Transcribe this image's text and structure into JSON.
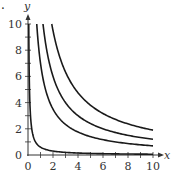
{
  "chart_data": {
    "type": "line",
    "title": "",
    "xlabel": "x",
    "ylabel": "y",
    "xlim": [
      0,
      10
    ],
    "ylim": [
      0,
      10
    ],
    "grid": false,
    "legend": null,
    "x_ticks": [
      0,
      2,
      4,
      6,
      8,
      10
    ],
    "y_ticks": [
      0,
      2,
      4,
      6,
      8,
      10
    ],
    "x_minor_step": 1,
    "y_minor_step": 1,
    "series": [
      {
        "name": "k=0.6",
        "k": 0.6,
        "x": [
          0.06,
          0.1,
          0.2,
          0.5,
          1,
          2,
          4,
          6,
          8,
          10
        ],
        "values": [
          10,
          6,
          3,
          1.2,
          0.6,
          0.3,
          0.15,
          0.1,
          0.075,
          0.06
        ]
      },
      {
        "name": "k=7",
        "k": 7,
        "x": [
          0.7,
          1,
          2,
          4,
          6,
          8,
          10
        ],
        "values": [
          10,
          7,
          3.5,
          1.75,
          1.17,
          0.88,
          0.7
        ]
      },
      {
        "name": "k=12",
        "k": 12,
        "x": [
          1.2,
          2,
          4,
          6,
          8,
          10
        ],
        "values": [
          10,
          6,
          3,
          2,
          1.5,
          1.2
        ]
      },
      {
        "name": "k=19",
        "k": 19,
        "x": [
          1.9,
          2,
          4,
          6,
          8,
          10
        ],
        "values": [
          10,
          9.5,
          4.75,
          3.17,
          2.38,
          1.9
        ]
      }
    ]
  },
  "labels": {
    "x_axis": "x",
    "y_axis": "y",
    "corner_mark": "."
  },
  "colors": {
    "curve": "#1a1a1a",
    "axis": "#333333"
  }
}
